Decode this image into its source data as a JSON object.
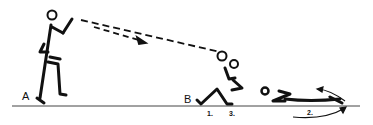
{
  "diagram": {
    "type": "exercise-illustration",
    "positions": [
      {
        "id": "A",
        "label": "A"
      },
      {
        "id": "B",
        "label": "B"
      }
    ],
    "steps": [
      {
        "id": "step1",
        "label": "1."
      },
      {
        "id": "step2",
        "label": "2."
      },
      {
        "id": "step3",
        "label": "3."
      }
    ],
    "colors": {
      "ink": "#111111",
      "background": "#ffffff"
    }
  }
}
